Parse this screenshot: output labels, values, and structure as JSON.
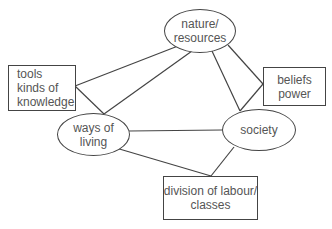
{
  "diagram": {
    "type": "concept-network",
    "line_color": "#444444",
    "text_color": "#555555",
    "nodes": {
      "nature": {
        "shape": "ellipse",
        "lines": [
          "nature/",
          "resources"
        ]
      },
      "tools": {
        "shape": "rectangle",
        "lines": [
          "tools",
          "kinds of",
          "knowledge"
        ]
      },
      "beliefs": {
        "shape": "rectangle",
        "lines": [
          "beliefs",
          "power"
        ]
      },
      "ways": {
        "shape": "ellipse",
        "lines": [
          "ways of",
          "living"
        ]
      },
      "society": {
        "shape": "ellipse",
        "lines": [
          "society"
        ]
      },
      "division": {
        "shape": "rectangle",
        "lines": [
          "division of labour/",
          "classes"
        ]
      }
    },
    "edges": [
      [
        "tools",
        "nature"
      ],
      [
        "tools",
        "ways"
      ],
      [
        "nature",
        "ways"
      ],
      [
        "nature",
        "society"
      ],
      [
        "beliefs",
        "nature"
      ],
      [
        "beliefs",
        "society"
      ],
      [
        "ways",
        "society"
      ],
      [
        "ways",
        "division"
      ],
      [
        "society",
        "division"
      ]
    ]
  }
}
